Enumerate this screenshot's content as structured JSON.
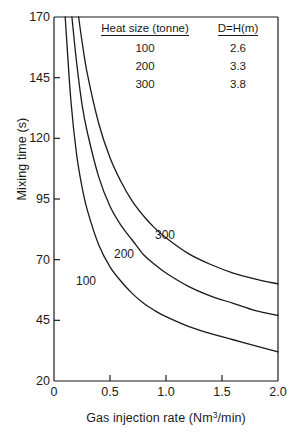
{
  "chart_data": {
    "type": "line",
    "title": "",
    "xlabel": "Gas injection rate (Nm3/min)",
    "xlabel_base": "Gas injection rate (Nm",
    "xlabel_sup": "3",
    "xlabel_tail": "/min)",
    "ylabel": "Mixing time (s)",
    "xlim": [
      0,
      2.0
    ],
    "ylim": [
      20,
      170
    ],
    "xticks": [
      0,
      0.5,
      1.0,
      1.5,
      2.0
    ],
    "xtick_labels": [
      "0",
      "0.5",
      "1.0",
      "1.5",
      "2.0"
    ],
    "yticks": [
      20,
      45,
      70,
      95,
      120,
      145,
      170
    ],
    "ytick_labels": [
      "20",
      "45",
      "70",
      "95",
      "120",
      "145",
      "170"
    ],
    "grid": false,
    "legend_position": "inside-top-right",
    "line_color": "#1a1a1a",
    "series": [
      {
        "name": "100",
        "label": "100",
        "heat_size_tonne": 100,
        "d_equals_h_m": "2.6",
        "x": [
          0.1,
          0.15,
          0.2,
          0.25,
          0.3,
          0.4,
          0.5,
          0.6,
          0.7,
          0.8,
          0.9,
          1.0,
          1.2,
          1.4,
          1.6,
          1.8,
          2.0
        ],
        "y": [
          170,
          136,
          114,
          100,
          90,
          76,
          67,
          61,
          56,
          52,
          49,
          46.5,
          42.5,
          39.5,
          37,
          34.5,
          32
        ]
      },
      {
        "name": "200",
        "label": "200",
        "heat_size_tonne": 200,
        "d_equals_h_m": "3.3",
        "x": [
          0.16,
          0.2,
          0.25,
          0.3,
          0.4,
          0.5,
          0.6,
          0.7,
          0.8,
          0.9,
          1.0,
          1.2,
          1.4,
          1.6,
          1.8,
          2.0
        ],
        "y": [
          170,
          152,
          134,
          122,
          104,
          92,
          84,
          78,
          72,
          68,
          64.5,
          59,
          55,
          52,
          49,
          47
        ]
      },
      {
        "name": "300",
        "label": "300",
        "heat_size_tonne": 300,
        "d_equals_h_m": "3.8",
        "x": [
          0.22,
          0.25,
          0.3,
          0.4,
          0.5,
          0.6,
          0.7,
          0.8,
          0.9,
          1.0,
          1.2,
          1.4,
          1.6,
          1.8,
          2.0
        ],
        "y": [
          170,
          160,
          146,
          126,
          112,
          102,
          94,
          88,
          83,
          79,
          72.5,
          68,
          64.5,
          62,
          60
        ]
      }
    ],
    "curve_labels": [
      {
        "text": "100",
        "x_px": 76,
        "y_px": 275
      },
      {
        "text": "200",
        "x_px": 114,
        "y_px": 248
      },
      {
        "text": "300",
        "x_px": 155,
        "y_px": 229
      }
    ]
  },
  "legend": {
    "headers": {
      "heat_size": "Heat size (tonne)",
      "d_h": "D=H(m)"
    },
    "rows": [
      {
        "heat_size": "100",
        "d_h": "2.6"
      },
      {
        "heat_size": "200",
        "d_h": "3.3"
      },
      {
        "heat_size": "300",
        "d_h": "3.8"
      }
    ]
  }
}
